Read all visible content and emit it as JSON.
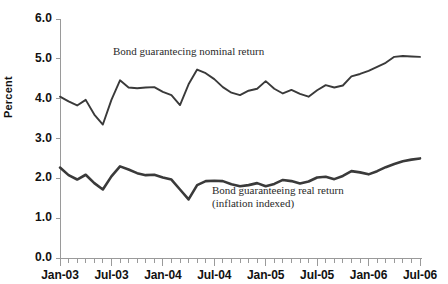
{
  "chart_data": {
    "type": "line",
    "title": "",
    "xlabel": "",
    "ylabel": "Percent",
    "ylim": [
      0.0,
      6.0
    ],
    "ytick_labels": [
      "6.0",
      "5.0",
      "4.0",
      "3.0",
      "2.0",
      "1.0",
      "0.0"
    ],
    "ytick_values": [
      6.0,
      5.0,
      4.0,
      3.0,
      2.0,
      1.0,
      0.0
    ],
    "xtick_labels": [
      "Jan-03",
      "Jul-03",
      "Jan-04",
      "Jul-04",
      "Jan-05",
      "Jul-05",
      "Jan-06",
      "Jul-06"
    ],
    "xtick_values": [
      0,
      6,
      12,
      18,
      24,
      30,
      36,
      42
    ],
    "x_minor_ticks_per_major": 6,
    "grid": false,
    "legend": "annotations-inline",
    "line_color": "#3a3a3a",
    "axis_color": "#9a9a9a",
    "x": [
      "Jan-03",
      "Feb-03",
      "Mar-03",
      "Apr-03",
      "May-03",
      "Jun-03",
      "Jul-03",
      "Aug-03",
      "Sep-03",
      "Oct-03",
      "Nov-03",
      "Dec-03",
      "Jan-04",
      "Feb-04",
      "Mar-04",
      "Apr-04",
      "May-04",
      "Jun-04",
      "Jul-04",
      "Aug-04",
      "Sep-04",
      "Oct-04",
      "Nov-04",
      "Dec-04",
      "Jan-05",
      "Feb-05",
      "Mar-05",
      "Apr-05",
      "May-05",
      "Jun-05",
      "Jul-05",
      "Aug-05",
      "Sep-05",
      "Oct-05",
      "Nov-05",
      "Dec-05",
      "Jan-06",
      "Feb-06",
      "Mar-06",
      "Apr-06",
      "May-06",
      "Jun-06",
      "Jul-06"
    ],
    "series": [
      {
        "name": "Bond guaranteeing nominal return",
        "label_line1": "Bond guarantecing nominal return",
        "label_line2": "",
        "values": [
          4.05,
          3.93,
          3.83,
          3.97,
          3.6,
          3.35,
          3.97,
          4.46,
          4.28,
          4.26,
          4.28,
          4.29,
          4.17,
          4.09,
          3.84,
          4.36,
          4.73,
          4.64,
          4.49,
          4.29,
          4.15,
          4.09,
          4.2,
          4.25,
          4.44,
          4.25,
          4.13,
          4.22,
          4.12,
          4.05,
          4.21,
          4.34,
          4.28,
          4.33,
          4.56,
          4.62,
          4.7,
          4.8,
          4.9,
          5.05,
          5.07,
          5.06,
          5.05
        ]
      },
      {
        "name": "Bond guaranteeing real return (inflation indexed)",
        "label_line1": "Bond guaranteeing real return",
        "label_line2": "(inflation indexed)",
        "values": [
          2.27,
          2.08,
          1.97,
          2.09,
          1.88,
          1.72,
          2.05,
          2.3,
          2.22,
          2.13,
          2.08,
          2.09,
          2.02,
          1.97,
          1.72,
          1.47,
          1.83,
          1.93,
          1.94,
          1.93,
          1.85,
          1.8,
          1.83,
          1.88,
          1.8,
          1.86,
          1.96,
          1.93,
          1.87,
          1.92,
          2.02,
          2.04,
          1.98,
          2.06,
          2.18,
          2.15,
          2.1,
          2.18,
          2.28,
          2.36,
          2.43,
          2.47,
          2.5
        ]
      }
    ],
    "annotations": [
      {
        "id": "nominal-label",
        "text": "Bond guarantecing nominal return",
        "x_px": 113,
        "y_px": 52
      },
      {
        "id": "real-label-line1",
        "text": "Bond guaranteeing real return",
        "x_px": 212,
        "y_px": 190
      },
      {
        "id": "real-label-line2",
        "text": "(inflation indexed)",
        "x_px": 212,
        "y_px": 203
      }
    ]
  }
}
